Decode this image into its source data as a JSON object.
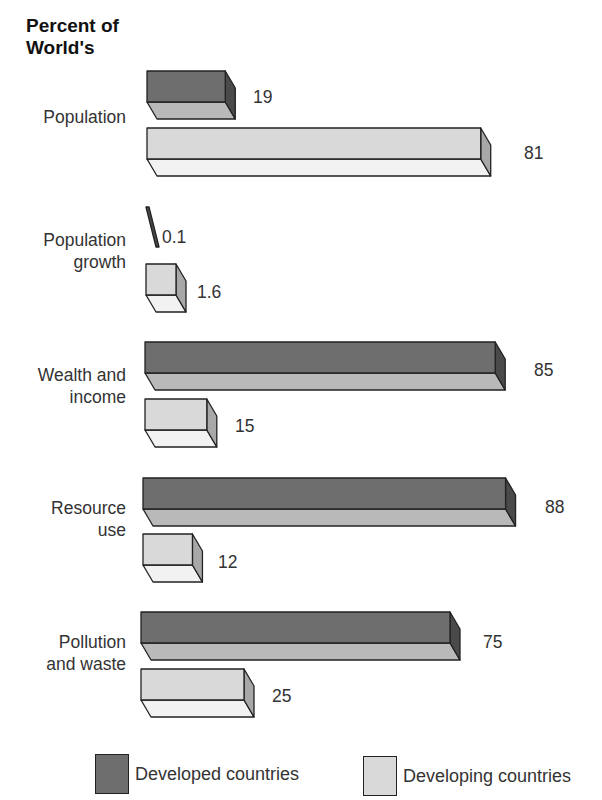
{
  "title": "Percent of\nWorld's",
  "title_lines": [
    "Percent of",
    "World's"
  ],
  "colors": {
    "developed_front": "#6e6e6e",
    "developed_bottom": "#b9b9b9",
    "developed_side": "#4a4a4a",
    "developing_front": "#d9d9d9",
    "developing_bottom": "#f2f2f2",
    "developing_side": "#a8a8a8",
    "outline": "#222222"
  },
  "legend": {
    "developed": "Developed countries",
    "developing": "Developing countries"
  },
  "categories": [
    {
      "label_lines": [
        "Population"
      ],
      "developed": "19",
      "developing": "81"
    },
    {
      "label_lines": [
        "Population",
        "growth"
      ],
      "developed": "0.1",
      "developing": "1.6"
    },
    {
      "label_lines": [
        "Wealth and",
        "income"
      ],
      "developed": "85",
      "developing": "15"
    },
    {
      "label_lines": [
        "Resource",
        "use"
      ],
      "developed": "88",
      "developing": "12"
    },
    {
      "label_lines": [
        "Pollution",
        "and waste"
      ],
      "developed": "75",
      "developing": "25"
    }
  ],
  "chart_data": {
    "type": "bar",
    "orientation": "horizontal",
    "title": "Percent of World's",
    "categories": [
      "Population",
      "Population growth",
      "Wealth and income",
      "Resource use",
      "Pollution and waste"
    ],
    "series": [
      {
        "name": "Developed countries",
        "values": [
          19,
          0.1,
          85,
          88,
          75
        ]
      },
      {
        "name": "Developing countries",
        "values": [
          81,
          1.6,
          15,
          12,
          25
        ]
      }
    ],
    "xlabel": "",
    "ylabel": "",
    "grid": false,
    "legend_position": "bottom",
    "style": "3d"
  }
}
